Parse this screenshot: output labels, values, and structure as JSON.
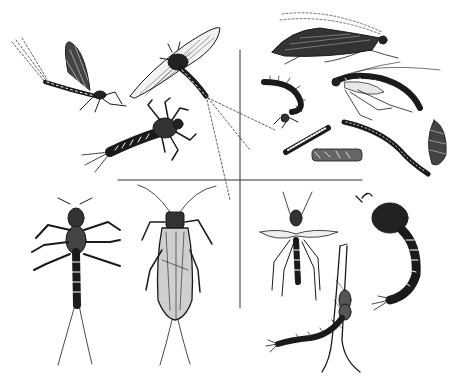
{
  "illustration": {
    "subject": "aquatic insects",
    "style": "black and white pen-and-ink",
    "background": "#ffffff",
    "ink": "#1a1a1a",
    "layout": "four quadrants separated by crossing lines",
    "quadrants": [
      {
        "position": "top-left",
        "group": "mayflies",
        "figures": [
          "adult mayfly (spinner) in profile",
          "adult mayfly (dun) flying",
          "mayfly nymph"
        ]
      },
      {
        "position": "top-right",
        "group": "caddisflies",
        "figures": [
          "adult caddisfly at rest",
          "adult caddisfly",
          "caddis larva",
          "caddis cases (4)"
        ]
      },
      {
        "position": "bottom-left",
        "group": "stoneflies",
        "figures": [
          "stonefly nymph",
          "adult stonefly"
        ]
      },
      {
        "position": "bottom-right",
        "group": "midges",
        "figures": [
          "adult midge",
          "midge pupa",
          "midge larva on stem"
        ]
      }
    ]
  }
}
